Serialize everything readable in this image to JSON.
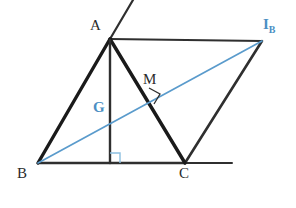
{
  "figure": {
    "type": "geometry-diagram",
    "background_color": "#ffffff",
    "canvas": {
      "width": 296,
      "height": 208
    }
  },
  "colors": {
    "stroke_dark": "#2f2f2f",
    "stroke_black": "#1a1a1a",
    "accent_blue": "#5a9bcc",
    "label_blue": "#4b8fc4",
    "label_dark": "#2b2b2b",
    "right_angle_blue": "#8cbfe0"
  },
  "points": {
    "A": {
      "label": "A",
      "x": 110,
      "y": 39,
      "label_x": 92,
      "label_y": 20,
      "color": "#2b2b2b"
    },
    "B": {
      "label": "B",
      "x": 38,
      "y": 163,
      "label_x": 19,
      "label_y": 168,
      "color": "#2b2b2b"
    },
    "C": {
      "label": "C",
      "x": 185,
      "y": 163,
      "label_x": 181,
      "label_y": 168,
      "color": "#2b2b2b"
    },
    "IB": {
      "label": "I",
      "sub": "B",
      "x": 262,
      "y": 40,
      "label_x": 264,
      "label_y": 19,
      "color": "#4b8fc4"
    },
    "M": {
      "label": "M",
      "x": 155,
      "y": 97,
      "label_x": 145,
      "label_y": 73,
      "color": "#2b2b2b"
    },
    "G": {
      "label": "G",
      "x": 110,
      "y": 113,
      "label_x": 94,
      "label_y": 101,
      "color": "#4b8fc4"
    },
    "H": {
      "label": "",
      "x": 110,
      "y": 163
    }
  },
  "segments": [
    {
      "name": "side-AB",
      "from": "A",
      "to": "B",
      "color": "#1a1a1a",
      "width": 3.2
    },
    {
      "name": "side-AC",
      "from": "A",
      "to": "C",
      "color": "#1a1a1a",
      "width": 3.2
    },
    {
      "name": "side-BC",
      "from": "B",
      "to": "C",
      "color": "#2f2f2f",
      "width": 2.6
    },
    {
      "name": "side-A-IB",
      "from": "A",
      "to": "IB",
      "color": "#2f2f2f",
      "width": 2.2
    },
    {
      "name": "side-C-IB",
      "from": "C",
      "to": "IB",
      "color": "#2f2f2f",
      "width": 2.6
    },
    {
      "name": "altitude-A-H",
      "from": "A",
      "to": "H",
      "color": "#2f2f2f",
      "width": 2.4
    },
    {
      "name": "cevian-B-IB",
      "from": "B",
      "to": "IB",
      "color": "#5a9bcc",
      "width": 1.6
    }
  ],
  "rays": [
    {
      "name": "ray-through-A",
      "x1": 110,
      "y1": 39,
      "x2": 133,
      "y2": 0,
      "color": "#2f2f2f",
      "width": 2.2
    },
    {
      "name": "ray-BC-extension",
      "x1": 185,
      "y1": 163,
      "x2": 232,
      "y2": 163,
      "color": "#2f2f2f",
      "width": 2.2
    }
  ],
  "right_angles": [
    {
      "name": "right-angle-at-H",
      "x": 110,
      "y": 163,
      "size": 10,
      "orientation": "up-right",
      "color": "#8cbfe0"
    },
    {
      "name": "right-angle-at-M",
      "x": 155,
      "y": 97,
      "size": 9,
      "rotation": -31,
      "color": "#2f2f2f"
    }
  ],
  "labels": {
    "A": "A",
    "B": "B",
    "C": "C",
    "M": "M",
    "G": "G",
    "IB_main": "I",
    "IB_sub": "B"
  }
}
